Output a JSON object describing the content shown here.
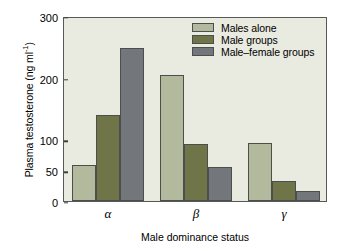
{
  "chart_data": {
    "type": "bar",
    "title": "",
    "xlabel": "Male dominance status",
    "ylabel": "Plasma testosterone (ng ml",
    "ylabel_sup": "-1",
    "ylabel_suffix": ")",
    "categories": [
      "α",
      "β",
      "γ"
    ],
    "series": [
      {
        "name": "Males alone",
        "color": "#b3b99c",
        "values": [
          58,
          205,
          94
        ]
      },
      {
        "name": "Male groups",
        "color": "#6f7548",
        "values": [
          140,
          93,
          32
        ]
      },
      {
        "name": "Male–female groups",
        "color": "#73767a",
        "values": [
          248,
          55,
          17
        ]
      }
    ],
    "ylim": [
      0,
      300
    ],
    "yticks": [
      0,
      50,
      100,
      200,
      300
    ],
    "ytick_labels": [
      "0",
      "50",
      "100",
      "200",
      "300"
    ],
    "grid": false,
    "legend_position": "top-right",
    "plot_background": "#e9eae0",
    "axis_color": "#555a55"
  }
}
